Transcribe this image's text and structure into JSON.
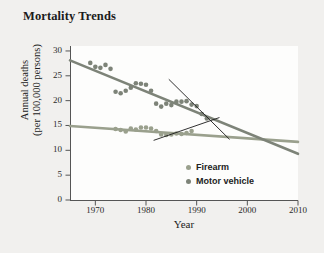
{
  "chart_data": {
    "type": "scatter",
    "title": "Mortality Trends",
    "xlabel": "Year",
    "ylabel_line1": "Annual deaths",
    "ylabel_line2": "(per 100,000 persons)",
    "xlim": [
      1965,
      2010
    ],
    "ylim": [
      0,
      31
    ],
    "xticks": [
      "1970",
      "1980",
      "1990",
      "2000",
      "2010"
    ],
    "xtick_values": [
      1970,
      1980,
      1990,
      2000,
      2010
    ],
    "yticks": [
      "0",
      "5",
      "10",
      "15",
      "20",
      "25",
      "30"
    ],
    "ytick_values": [
      0,
      5,
      10,
      15,
      20,
      25,
      30
    ],
    "grid": false,
    "legend_position": "inside-lower-right",
    "colors": {
      "firearm": "#9aa08d",
      "motor_vehicle": "#7d8378",
      "annotation": "#1a1a1a",
      "axis": "#555555",
      "plot_background": "#fdfdfc",
      "page_background": "#f1f0ee",
      "text": "#1b1b1b"
    },
    "series": [
      {
        "name": "Firearm",
        "marker": "circle",
        "color": "#9aa08d",
        "points": [
          [
            1974,
            14.3
          ],
          [
            1975,
            14.1
          ],
          [
            1976,
            13.8
          ],
          [
            1977,
            14.4
          ],
          [
            1978,
            14.2
          ],
          [
            1979,
            14.6
          ],
          [
            1980,
            14.6
          ],
          [
            1981,
            14.4
          ],
          [
            1982,
            13.9
          ],
          [
            1983,
            13.2
          ],
          [
            1984,
            13.1
          ],
          [
            1985,
            13.2
          ],
          [
            1986,
            13.4
          ],
          [
            1987,
            13.3
          ],
          [
            1988,
            13.5
          ],
          [
            1989,
            13.9
          ]
        ],
        "trend": {
          "x0": 1965,
          "y0": 14.9,
          "x1": 2010,
          "y1": 11.7
        }
      },
      {
        "name": "Motor vehicle",
        "marker": "circle",
        "color": "#7d8378",
        "points": [
          [
            1969,
            27.6
          ],
          [
            1970,
            26.8
          ],
          [
            1971,
            26.6
          ],
          [
            1972,
            27.2
          ],
          [
            1973,
            26.4
          ],
          [
            1974,
            21.8
          ],
          [
            1975,
            21.5
          ],
          [
            1976,
            22.0
          ],
          [
            1977,
            22.6
          ],
          [
            1978,
            23.5
          ],
          [
            1979,
            23.4
          ],
          [
            1980,
            23.2
          ],
          [
            1981,
            22.0
          ],
          [
            1982,
            19.4
          ],
          [
            1983,
            18.8
          ],
          [
            1984,
            19.4
          ],
          [
            1985,
            19.1
          ],
          [
            1986,
            19.8
          ],
          [
            1987,
            19.8
          ],
          [
            1988,
            19.9
          ],
          [
            1989,
            19.2
          ],
          [
            1990,
            18.9
          ],
          [
            1991,
            17.3
          ],
          [
            1992,
            16.4
          ]
        ],
        "trend": {
          "x0": 1965,
          "y0": 28.1,
          "x1": 2010,
          "y1": 9.3
        }
      }
    ],
    "annotations": [
      {
        "name": "upper-arrow",
        "x0": 1984.5,
        "y0": 24.3,
        "x1": 1996.5,
        "y1": 12.2
      },
      {
        "name": "lower-arrow",
        "x0": 1981.5,
        "y0": 12.0,
        "x1": 1994.5,
        "y1": 16.6
      }
    ]
  },
  "legend": {
    "items": [
      {
        "label": "Firearm",
        "color": "#9aa08d"
      },
      {
        "label": "Motor vehicle",
        "color": "#7d8378"
      }
    ]
  }
}
